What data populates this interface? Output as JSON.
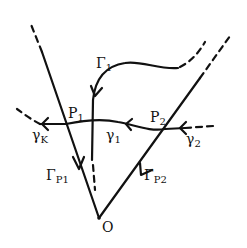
{
  "diagram": {
    "colors": {
      "ink": "#111111",
      "background": "#ffffff"
    },
    "points": {
      "O": {
        "label": "O",
        "x": 99,
        "y": 218
      },
      "P1": {
        "label": "P",
        "sub": "1",
        "x": 66,
        "y": 124
      },
      "P2": {
        "label": "P",
        "sub": "2",
        "x": 165,
        "y": 129
      }
    },
    "labels": {
      "gamma1_main": {
        "text": "Γ",
        "sub": "1"
      },
      "gamma_p1": {
        "text": "Γ",
        "sub": "P1"
      },
      "gamma_p2": {
        "text": "Γ",
        "sub": "P2"
      },
      "gamma_small_1": {
        "text": "γ",
        "sub": "1"
      },
      "gamma_small_2": {
        "text": "γ",
        "sub": "2"
      },
      "gamma_small_k": {
        "text": "γ",
        "sub": "K"
      },
      "p1": {
        "text": "P",
        "sub": "1"
      },
      "p2": {
        "text": "P",
        "sub": "2"
      },
      "origin": {
        "text": "O"
      }
    }
  }
}
